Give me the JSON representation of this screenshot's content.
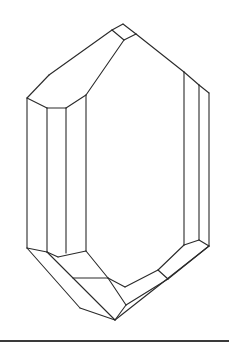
{
  "figure": {
    "type": "crystal-line-drawing",
    "stroke_color": "#2a2a2a",
    "background": "#ffffff",
    "edges": [
      [
        27,
        98,
        49,
        75
      ],
      [
        49,
        75,
        112,
        30
      ],
      [
        112,
        30,
        123,
        24
      ],
      [
        123,
        24,
        136,
        34
      ],
      [
        136,
        34,
        184,
        72
      ],
      [
        184,
        72,
        199,
        85
      ],
      [
        199,
        85,
        209,
        93
      ],
      [
        112,
        30,
        124,
        40
      ],
      [
        124,
        40,
        136,
        34
      ],
      [
        124,
        40,
        86,
        95
      ],
      [
        27,
        98,
        47,
        108
      ],
      [
        47,
        108,
        66,
        108
      ],
      [
        66,
        108,
        86,
        95
      ],
      [
        27,
        98,
        27,
        248
      ],
      [
        47,
        108,
        47,
        252
      ],
      [
        66,
        108,
        66,
        253
      ],
      [
        86,
        95,
        86,
        251
      ],
      [
        184,
        72,
        184,
        245
      ],
      [
        199,
        85,
        199,
        240
      ],
      [
        209,
        93,
        209,
        246
      ],
      [
        27,
        248,
        47,
        252
      ],
      [
        47,
        252,
        58,
        257
      ],
      [
        58,
        257,
        86,
        251
      ],
      [
        27,
        248,
        80,
        308
      ],
      [
        80,
        308,
        115,
        320
      ],
      [
        47,
        252,
        115,
        320
      ],
      [
        86,
        251,
        108,
        278
      ],
      [
        108,
        278,
        125,
        287
      ],
      [
        108,
        278,
        126,
        305
      ],
      [
        73,
        278,
        108,
        278
      ],
      [
        125,
        287,
        158,
        270
      ],
      [
        158,
        270,
        168,
        279
      ],
      [
        168,
        279,
        126,
        305
      ],
      [
        184,
        245,
        158,
        270
      ],
      [
        199,
        240,
        209,
        246
      ],
      [
        184,
        245,
        199,
        240
      ],
      [
        209,
        246,
        168,
        279
      ],
      [
        209,
        246,
        115,
        320
      ],
      [
        126,
        305,
        115,
        320
      ]
    ],
    "baseline": {
      "y": 341,
      "x_start": 0,
      "x_end": 229
    }
  }
}
